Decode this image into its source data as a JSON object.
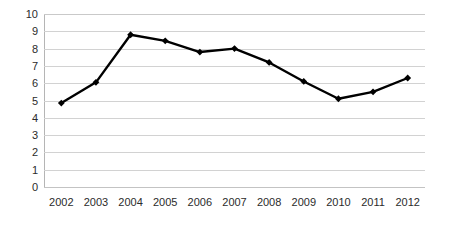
{
  "chart_data": {
    "type": "line",
    "title": "",
    "subtitle": "",
    "xlabel": "",
    "ylabel": "",
    "categories": [
      "2002",
      "2003",
      "2004",
      "2005",
      "2006",
      "2007",
      "2008",
      "2009",
      "2010",
      "2011",
      "2012"
    ],
    "values": [
      4.85,
      6.05,
      8.8,
      8.45,
      7.8,
      8.0,
      7.2,
      6.1,
      5.1,
      5.5,
      6.3
    ],
    "series": [
      {
        "name": "",
        "values": [
          4.85,
          6.05,
          8.8,
          8.45,
          7.8,
          8.0,
          7.2,
          6.1,
          5.1,
          5.5,
          6.3
        ]
      }
    ],
    "ylim": [
      0,
      10
    ],
    "ytick_labels": [
      "0",
      "1",
      "2",
      "3",
      "4",
      "5",
      "6",
      "7",
      "8",
      "9",
      "10"
    ],
    "ytick_values": [
      0,
      1,
      2,
      3,
      4,
      5,
      6,
      7,
      8,
      9,
      10
    ],
    "grid": true,
    "grid_axis": "y",
    "legend": false,
    "legend_position": "none",
    "marker": "diamond",
    "colors": {
      "line": "#000000",
      "marker": "#000000",
      "gridline": "#d2d2d2",
      "axis": "#b5b5b5",
      "text": "#2b2b2b",
      "background": "#ffffff"
    }
  }
}
